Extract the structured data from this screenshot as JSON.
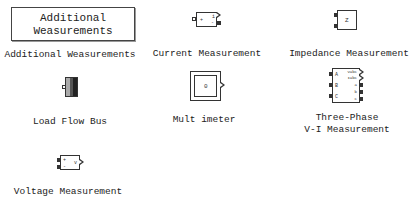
{
  "library": {
    "blocks": [
      {
        "id": "additional-measurements",
        "label": "Additional Weasurements",
        "icon_text_line1": "Additional",
        "icon_text_line2": "Weasurements"
      },
      {
        "id": "current-measurement",
        "label": "Current Measurement",
        "icon_text_plus": "i",
        "icon_text_minus": "-",
        "icon_text_in": "+"
      },
      {
        "id": "impedance-measurement",
        "label": "Impedance Measurement",
        "icon_text": "Z"
      },
      {
        "id": "load-flow-bus",
        "label": "Load Flow Bus"
      },
      {
        "id": "multimeter",
        "label": "Mult imeter",
        "icon_text": "0"
      },
      {
        "id": "three-phase-vi-measurement",
        "label": "Three-Phase\nV-I Measurement",
        "ports_left": [
          "A",
          "B",
          "C"
        ],
        "ports_right": [
          "Vabc",
          "Iabc",
          "a",
          "b",
          "c"
        ]
      },
      {
        "id": "voltage-measurement",
        "label": "Voltage Measurement",
        "icon_text_plus": "+",
        "icon_text_minus": "-",
        "icon_text_out": "v"
      }
    ]
  }
}
